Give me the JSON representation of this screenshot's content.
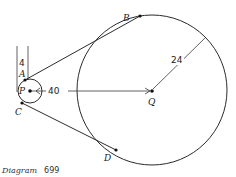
{
  "diagram": {
    "caption_word": "Diagram",
    "caption_number": "699",
    "points": {
      "A": "A",
      "B": "B",
      "C": "C",
      "D": "D",
      "P": "P",
      "Q": "Q"
    },
    "measurements": {
      "small_gap": "4",
      "center_distance": "40",
      "large_radius": "24"
    },
    "colors": {
      "ink": "#2b2b2b",
      "background": "#ffffff"
    }
  }
}
